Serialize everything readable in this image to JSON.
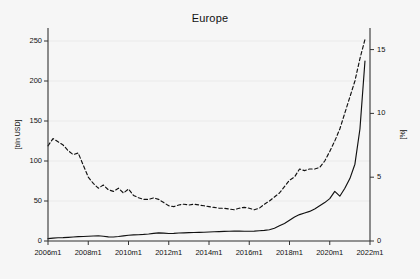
{
  "chart_data": {
    "type": "line",
    "title": "Europe",
    "xlabel": "",
    "ylabel": "[bln USD]",
    "ylabel_right": "[%]",
    "grid": true,
    "legend": "none",
    "xlim": [
      "2006m1",
      "2022m1"
    ],
    "xticks": [
      "2006m1",
      "2008m1",
      "2010m1",
      "2012m1",
      "2014m1",
      "2016m1",
      "2018m1",
      "2020m1",
      "2022m1"
    ],
    "ylim_left": [
      0,
      260
    ],
    "yticks_left": [
      0,
      50,
      100,
      150,
      200,
      250
    ],
    "ylim_right": [
      0,
      16.3
    ],
    "yticks_right": [
      0,
      5,
      10,
      15
    ],
    "axis_color": "#333333",
    "grid_color": "#e8e8e8",
    "series": [
      {
        "name": "volume",
        "style": "solid",
        "color": "#111111",
        "axis": "left",
        "x": [
          "2006m1",
          "2006m4",
          "2006m7",
          "2006m10",
          "2007m1",
          "2007m4",
          "2007m7",
          "2007m10",
          "2008m1",
          "2008m4",
          "2008m7",
          "2008m10",
          "2009m1",
          "2009m4",
          "2009m7",
          "2009m10",
          "2010m1",
          "2010m4",
          "2010m7",
          "2010m10",
          "2011m1",
          "2011m4",
          "2011m7",
          "2011m10",
          "2012m1",
          "2012m4",
          "2012m7",
          "2012m10",
          "2013m1",
          "2013m4",
          "2013m7",
          "2013m10",
          "2014m1",
          "2014m4",
          "2014m7",
          "2014m10",
          "2015m1",
          "2015m4",
          "2015m7",
          "2015m10",
          "2016m1",
          "2016m4",
          "2016m7",
          "2016m10",
          "2017m1",
          "2017m4",
          "2017m7",
          "2017m10",
          "2018m1",
          "2018m4",
          "2018m7",
          "2018m10",
          "2019m1",
          "2019m4",
          "2019m7",
          "2019m10",
          "2020m1",
          "2020m4",
          "2020m7",
          "2020m10",
          "2021m1",
          "2021m4",
          "2021m7",
          "2021m10"
        ],
        "values": [
          3.0,
          3.6,
          4.0,
          4.2,
          4.6,
          5.0,
          5.4,
          5.6,
          6.0,
          6.3,
          6.5,
          6.0,
          5.2,
          5.0,
          5.6,
          6.4,
          7.2,
          7.6,
          7.8,
          8.2,
          8.8,
          9.6,
          10.2,
          9.8,
          9.4,
          9.6,
          10.0,
          10.2,
          10.4,
          10.6,
          10.8,
          11.0,
          11.2,
          11.5,
          11.8,
          12.0,
          12.2,
          12.4,
          12.4,
          12.2,
          12.2,
          12.4,
          12.8,
          13.2,
          14.0,
          16.0,
          19.0,
          22.0,
          26.0,
          30.0,
          33.0,
          35.0,
          37.0,
          40.0,
          44.0,
          48.0,
          53.0,
          62.0,
          56.0,
          66.0,
          78.0,
          96.0,
          140.0,
          225.0
        ]
      },
      {
        "name": "share",
        "style": "dashed",
        "color": "#111111",
        "axis": "left",
        "x": [
          "2006m1",
          "2006m4",
          "2006m7",
          "2006m10",
          "2007m1",
          "2007m4",
          "2007m7",
          "2007m10",
          "2008m1",
          "2008m4",
          "2008m7",
          "2008m10",
          "2009m1",
          "2009m4",
          "2009m7",
          "2009m10",
          "2010m1",
          "2010m4",
          "2010m7",
          "2010m10",
          "2011m1",
          "2011m4",
          "2011m7",
          "2011m10",
          "2012m1",
          "2012m4",
          "2012m7",
          "2012m10",
          "2013m1",
          "2013m4",
          "2013m7",
          "2013m10",
          "2014m1",
          "2014m4",
          "2014m7",
          "2014m10",
          "2015m1",
          "2015m4",
          "2015m7",
          "2015m10",
          "2016m1",
          "2016m4",
          "2016m7",
          "2016m10",
          "2017m1",
          "2017m4",
          "2017m7",
          "2017m10",
          "2018m1",
          "2018m4",
          "2018m7",
          "2018m10",
          "2019m1",
          "2019m4",
          "2019m7",
          "2019m10",
          "2020m1",
          "2020m4",
          "2020m7",
          "2020m10",
          "2021m1",
          "2021m4",
          "2021m7",
          "2021m10"
        ],
        "values": [
          119.0,
          128.0,
          124.0,
          120.0,
          113.0,
          108.0,
          110.0,
          95.0,
          80.0,
          72.0,
          66.0,
          70.0,
          64.0,
          62.0,
          66.0,
          60.0,
          65.0,
          57.0,
          54.0,
          52.0,
          52.0,
          54.0,
          52.0,
          48.0,
          44.0,
          43.0,
          45.0,
          46.0,
          45.0,
          46.0,
          45.0,
          44.0,
          43.0,
          42.0,
          41.0,
          41.0,
          40.0,
          39.0,
          41.0,
          42.0,
          41.0,
          39.0,
          41.0,
          46.0,
          50.0,
          55.0,
          60.0,
          68.0,
          76.0,
          80.0,
          90.0,
          88.0,
          90.0,
          90.0,
          92.0,
          100.0,
          112.0,
          125.0,
          140.0,
          160.0,
          180.0,
          200.0,
          228.0,
          252.0
        ]
      }
    ]
  }
}
